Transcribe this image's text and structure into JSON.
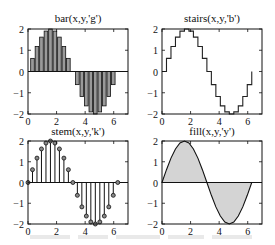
{
  "figure": {
    "layout": "2x2 subplots",
    "caption_visible": false
  },
  "chart_data": [
    {
      "type": "bar",
      "title": "bar(x,y,'g')",
      "xlabel": "",
      "ylabel": "",
      "xlim": [
        0,
        7
      ],
      "ylim": [
        -2,
        2
      ],
      "xticks": [
        0,
        2,
        4,
        6
      ],
      "yticks": [
        -2,
        -1,
        0,
        1,
        2
      ],
      "grid": false,
      "color": "#9a9a9a",
      "x": [
        0,
        0.314,
        0.628,
        0.942,
        1.257,
        1.571,
        1.885,
        2.199,
        2.513,
        2.827,
        3.142,
        3.456,
        3.77,
        4.084,
        4.398,
        4.712,
        5.027,
        5.341,
        5.655,
        5.969,
        6.283
      ],
      "values": [
        0,
        0.618,
        1.176,
        1.618,
        1.902,
        2.0,
        1.902,
        1.618,
        1.176,
        0.618,
        0,
        -0.618,
        -1.176,
        -1.618,
        -1.902,
        -2.0,
        -1.902,
        -1.618,
        -1.176,
        -0.618,
        0
      ]
    },
    {
      "type": "line",
      "subtype": "stairs",
      "title": "stairs(x,y,'b')",
      "xlabel": "",
      "ylabel": "",
      "xlim": [
        0,
        7
      ],
      "ylim": [
        -2,
        2
      ],
      "xticks": [
        0,
        2,
        4,
        6
      ],
      "yticks": [
        -2,
        -1,
        0,
        1,
        2
      ],
      "grid": false,
      "color": "#222222",
      "x": [
        0,
        0.314,
        0.628,
        0.942,
        1.257,
        1.571,
        1.885,
        2.199,
        2.513,
        2.827,
        3.142,
        3.456,
        3.77,
        4.084,
        4.398,
        4.712,
        5.027,
        5.341,
        5.655,
        5.969,
        6.283
      ],
      "values": [
        0,
        0.618,
        1.176,
        1.618,
        1.902,
        2.0,
        1.902,
        1.618,
        1.176,
        0.618,
        0,
        -0.618,
        -1.176,
        -1.618,
        -1.902,
        -2.0,
        -1.902,
        -1.618,
        -1.176,
        -0.618,
        0
      ]
    },
    {
      "type": "scatter",
      "subtype": "stem",
      "title": "stem(x,y,'k')",
      "xlabel": "",
      "ylabel": "",
      "xlim": [
        0,
        7
      ],
      "ylim": [
        -2,
        2
      ],
      "xticks": [
        0,
        2,
        4,
        6
      ],
      "yticks": [
        -2,
        -1,
        0,
        1,
        2
      ],
      "grid": false,
      "color": "#111111",
      "x": [
        0,
        0.314,
        0.628,
        0.942,
        1.257,
        1.571,
        1.885,
        2.199,
        2.513,
        2.827,
        3.142,
        3.456,
        3.77,
        4.084,
        4.398,
        4.712,
        5.027,
        5.341,
        5.655,
        5.969,
        6.283
      ],
      "values": [
        0,
        0.618,
        1.176,
        1.618,
        1.902,
        2.0,
        1.902,
        1.618,
        1.176,
        0.618,
        0,
        -0.618,
        -1.176,
        -1.618,
        -1.902,
        -2.0,
        -1.902,
        -1.618,
        -1.176,
        -0.618,
        0
      ]
    },
    {
      "type": "area",
      "subtype": "fill",
      "title": "fill(x,y,'y')",
      "xlabel": "",
      "ylabel": "",
      "xlim": [
        0,
        7
      ],
      "ylim": [
        -2,
        2
      ],
      "xticks": [
        0,
        2,
        4,
        6
      ],
      "yticks": [
        -2,
        -1,
        0,
        1,
        2
      ],
      "grid": false,
      "color": "#d4d4d4",
      "x": [
        0,
        0.314,
        0.628,
        0.942,
        1.257,
        1.571,
        1.885,
        2.199,
        2.513,
        2.827,
        3.142,
        3.456,
        3.77,
        4.084,
        4.398,
        4.712,
        5.027,
        5.341,
        5.655,
        5.969,
        6.283
      ],
      "values": [
        0,
        0.618,
        1.176,
        1.618,
        1.902,
        2.0,
        1.902,
        1.618,
        1.176,
        0.618,
        0,
        -0.618,
        -1.176,
        -1.618,
        -1.902,
        -2.0,
        -1.902,
        -1.618,
        -1.176,
        -0.618,
        0
      ]
    }
  ],
  "panels": [
    {
      "title": "bar(x,y,'g')"
    },
    {
      "title": "stairs(x,y,'b')"
    },
    {
      "title": "stem(x,y,'k')"
    },
    {
      "title": "fill(x,y,'y')"
    }
  ],
  "tick_labels": {
    "x": [
      "0",
      "2",
      "4",
      "6"
    ],
    "y": [
      "2",
      "1",
      "0",
      "−1",
      "−2"
    ]
  }
}
